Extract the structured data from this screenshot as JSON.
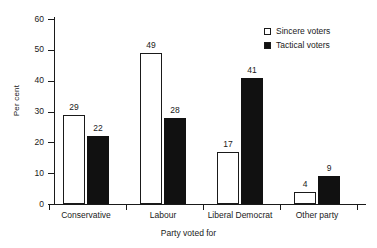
{
  "chart_data": {
    "type": "bar",
    "title": "",
    "xlabel": "Party voted for",
    "ylabel": "Per cent",
    "categories": [
      "Conservative",
      "Labour",
      "Liberal Democrat",
      "Other party"
    ],
    "series": [
      {
        "name": "Sincere voters",
        "values": [
          29,
          49,
          17,
          4
        ],
        "color": "#ffffff",
        "swatch": "open"
      },
      {
        "name": "Tactical voters",
        "values": [
          22,
          28,
          41,
          9
        ],
        "color": "#111111",
        "swatch": "filled"
      }
    ],
    "ylim": [
      0,
      60
    ],
    "yticks": [
      0,
      10,
      20,
      30,
      40,
      50,
      60
    ],
    "ytick_labels": [
      "0",
      "10",
      "20",
      "30",
      "40",
      "50",
      "60"
    ],
    "grid": false,
    "legend_position": "top-right"
  },
  "legend": {
    "entries": [
      {
        "label": "Sincere voters"
      },
      {
        "label": "Tactical voters"
      }
    ]
  }
}
